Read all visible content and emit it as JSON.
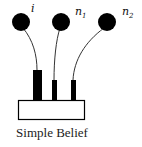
{
  "diagram": {
    "caption": "Simple Belief",
    "nodes": [
      {
        "label": "i",
        "sub": ""
      },
      {
        "label": "n",
        "sub": "1"
      },
      {
        "label": "n",
        "sub": "2"
      }
    ],
    "colors": {
      "node": "#000000",
      "box": "#ffffff",
      "stroke": "#000000"
    }
  }
}
